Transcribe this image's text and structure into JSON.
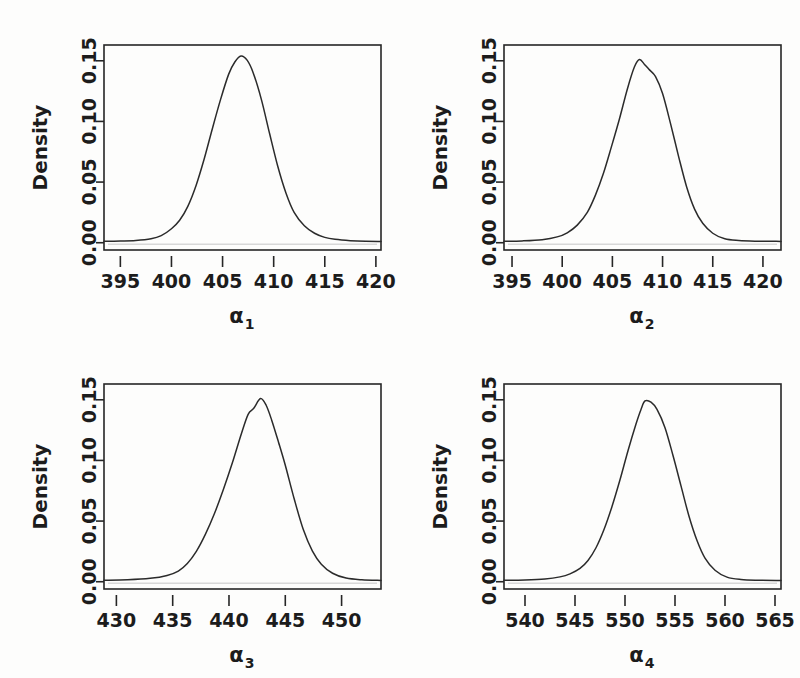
{
  "figure": {
    "background_color": "#fdfdfc",
    "line_color": "#2b2b2b",
    "axis_color": "#262626",
    "baseline_color": "#d8d8d8",
    "panel_count": 4,
    "layout": "2x2"
  },
  "chart_data": [
    {
      "type": "line",
      "title": "",
      "subtitle": "",
      "xlabel": "α",
      "xlabel_sub": "1",
      "ylabel": "Density",
      "xticks": [
        395,
        400,
        405,
        410,
        415,
        420
      ],
      "xticklabels": [
        "395",
        "400",
        "405",
        "410",
        "415",
        "420"
      ],
      "yticks": [
        0.0,
        0.05,
        0.1,
        0.15
      ],
      "yticklabels": [
        "0.00",
        "0.05",
        "0.10",
        "0.15"
      ],
      "xlim": [
        393.4,
        420.5
      ],
      "ylim": [
        -0.006,
        0.163
      ],
      "grid": false,
      "legend": null,
      "series": [
        {
          "name": "posterior density alpha1",
          "peak_x": 406.8,
          "peak_y": 0.154,
          "x": [
            393.4,
            395.0,
            396.5,
            398.0,
            399.0,
            400.0,
            400.8,
            401.6,
            402.4,
            403.2,
            404.0,
            404.8,
            405.6,
            406.2,
            406.8,
            407.4,
            408.0,
            408.8,
            409.6,
            410.4,
            411.2,
            412.0,
            413.0,
            414.0,
            415.0,
            416.0,
            417.5,
            419.0,
            420.5
          ],
          "y": [
            0.0012,
            0.0014,
            0.0018,
            0.0032,
            0.0058,
            0.0115,
            0.0185,
            0.03,
            0.047,
            0.069,
            0.094,
            0.118,
            0.139,
            0.149,
            0.154,
            0.1505,
            0.14,
            0.118,
            0.09,
            0.063,
            0.041,
            0.025,
            0.014,
            0.0078,
            0.0044,
            0.0028,
            0.0017,
            0.0012,
            0.0011
          ]
        }
      ]
    },
    {
      "type": "line",
      "title": "",
      "subtitle": "",
      "xlabel": "α",
      "xlabel_sub": "2",
      "ylabel": "Density",
      "xticks": [
        395,
        400,
        405,
        410,
        415,
        420
      ],
      "xticklabels": [
        "395",
        "400",
        "405",
        "410",
        "415",
        "420"
      ],
      "yticks": [
        0.0,
        0.05,
        0.1,
        0.15
      ],
      "yticklabels": [
        "0.00",
        "0.05",
        "0.10",
        "0.15"
      ],
      "xlim": [
        394.2,
        421.8
      ],
      "ylim": [
        -0.006,
        0.163
      ],
      "grid": false,
      "legend": null,
      "series": [
        {
          "name": "posterior density alpha2",
          "peak_x": 407.7,
          "peak_y": 0.151,
          "x": [
            394.2,
            396.0,
            398.0,
            399.5,
            400.5,
            401.5,
            402.5,
            403.3,
            404.1,
            404.9,
            405.7,
            406.5,
            407.2,
            407.7,
            408.2,
            408.7,
            409.3,
            410.0,
            410.8,
            411.6,
            412.4,
            413.2,
            414.0,
            415.0,
            416.2,
            417.6,
            419.2,
            421.8
          ],
          "y": [
            0.0012,
            0.0015,
            0.0025,
            0.0048,
            0.0082,
            0.0145,
            0.025,
            0.039,
            0.057,
            0.079,
            0.102,
            0.127,
            0.145,
            0.151,
            0.147,
            0.1425,
            0.137,
            0.123,
            0.098,
            0.071,
            0.046,
            0.0275,
            0.016,
            0.0078,
            0.0032,
            0.0018,
            0.0013,
            0.0011
          ]
        }
      ]
    },
    {
      "type": "line",
      "title": "",
      "subtitle": "",
      "xlabel": "α",
      "xlabel_sub": "3",
      "ylabel": "Density",
      "xticks": [
        430,
        435,
        440,
        445,
        450
      ],
      "xticklabels": [
        "430",
        "435",
        "440",
        "445",
        "450"
      ],
      "yticks": [
        0.0,
        0.05,
        0.1,
        0.15
      ],
      "yticklabels": [
        "0.00",
        "0.05",
        "0.10",
        "0.15"
      ],
      "xlim": [
        428.9,
        453.5
      ],
      "ylim": [
        -0.006,
        0.163
      ],
      "grid": false,
      "legend": null,
      "series": [
        {
          "name": "posterior density alpha3",
          "peak_x": 442.8,
          "peak_y": 0.151,
          "x": [
            428.9,
            431.0,
            433.0,
            434.5,
            435.5,
            436.3,
            437.1,
            437.9,
            438.7,
            439.5,
            440.3,
            441.1,
            441.7,
            442.2,
            442.8,
            443.3,
            443.8,
            444.4,
            445.0,
            445.8,
            446.6,
            447.4,
            448.2,
            449.2,
            450.4,
            451.8,
            453.5
          ],
          "y": [
            0.0012,
            0.0016,
            0.0028,
            0.0052,
            0.0088,
            0.015,
            0.025,
            0.039,
            0.056,
            0.076,
            0.098,
            0.122,
            0.138,
            0.143,
            0.151,
            0.1455,
            0.133,
            0.115,
            0.096,
            0.068,
            0.043,
            0.0255,
            0.0145,
            0.007,
            0.003,
            0.0016,
            0.0011
          ]
        }
      ]
    },
    {
      "type": "line",
      "title": "",
      "subtitle": "",
      "xlabel": "α",
      "xlabel_sub": "4",
      "ylabel": "Density",
      "xticks": [
        540,
        545,
        550,
        555,
        560,
        565
      ],
      "xticklabels": [
        "540",
        "545",
        "550",
        "555",
        "560",
        "565"
      ],
      "yticks": [
        0.0,
        0.05,
        0.1,
        0.15
      ],
      "yticklabels": [
        "0.00",
        "0.05",
        "0.10",
        "0.15"
      ],
      "xlim": [
        537.9,
        565.6
      ],
      "ylim": [
        -0.006,
        0.163
      ],
      "grid": false,
      "legend": null,
      "series": [
        {
          "name": "posterior density alpha4",
          "peak_x": 552.0,
          "peak_y": 0.149,
          "x": [
            537.9,
            540.0,
            542.0,
            543.5,
            544.5,
            545.5,
            546.3,
            547.1,
            547.9,
            548.7,
            549.5,
            550.3,
            551.1,
            551.6,
            552.0,
            552.6,
            553.2,
            554.0,
            554.8,
            555.6,
            556.4,
            557.2,
            558.0,
            559.0,
            560.2,
            561.6,
            563.2,
            565.6
          ],
          "y": [
            0.0012,
            0.0014,
            0.0022,
            0.004,
            0.0065,
            0.011,
            0.0175,
            0.028,
            0.043,
            0.062,
            0.084,
            0.108,
            0.13,
            0.142,
            0.149,
            0.148,
            0.142,
            0.127,
            0.104,
            0.079,
            0.054,
            0.034,
            0.0195,
            0.0095,
            0.0038,
            0.0018,
            0.0012,
            0.0011
          ]
        }
      ]
    }
  ]
}
